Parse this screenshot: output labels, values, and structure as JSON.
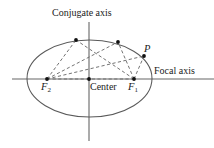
{
  "figure": {
    "type": "geometry-diagram",
    "width": 214,
    "height": 148,
    "background_color": "#ffffff",
    "stroke_color": "#4d4d4d",
    "dash_color": "#6b6b6b",
    "point_color": "#111111",
    "text_color": "#1a1a1a"
  },
  "labels": {
    "conjugate_axis": "Conjugate axis",
    "focal_axis": "Focal axis",
    "center": "Center",
    "focus_1": "F",
    "focus_1_sub": "1",
    "focus_2": "F",
    "focus_2_sub": "2",
    "point_p": "P"
  },
  "geometry": {
    "ellipse": {
      "cx": 89.5,
      "cy": 78.5,
      "rx": 62.5,
      "ry": 38.5
    },
    "focal_axis_line": {
      "x1": 12,
      "y1": 79,
      "x2": 214,
      "y2": 79
    },
    "conjugate_axis_line": {
      "x1": 89,
      "y1": 22,
      "x2": 89,
      "y2": 141
    },
    "points": [
      {
        "name": "center",
        "x": 89,
        "y": 79
      },
      {
        "name": "focus-1",
        "x": 134,
        "y": 79
      },
      {
        "name": "focus-2",
        "x": 47,
        "y": 79
      },
      {
        "name": "ellipse-point-a",
        "x": 76,
        "y": 40
      },
      {
        "name": "ellipse-point-b",
        "x": 118,
        "y": 42
      },
      {
        "name": "ellipse-point-p",
        "x": 144,
        "y": 56
      }
    ],
    "dashed_segments": [
      {
        "name": "f2-to-a",
        "x1": 47,
        "y1": 79,
        "x2": 76,
        "y2": 40
      },
      {
        "name": "f1-to-a",
        "x1": 134,
        "y1": 79,
        "x2": 76,
        "y2": 40
      },
      {
        "name": "f2-to-b",
        "x1": 47,
        "y1": 79,
        "x2": 118,
        "y2": 42
      },
      {
        "name": "f1-to-b",
        "x1": 134,
        "y1": 79,
        "x2": 118,
        "y2": 42
      },
      {
        "name": "f2-to-p",
        "x1": 47,
        "y1": 79,
        "x2": 144,
        "y2": 56
      },
      {
        "name": "f1-to-p",
        "x1": 134,
        "y1": 79,
        "x2": 144,
        "y2": 56
      },
      {
        "name": "f2-to-f1",
        "x1": 47,
        "y1": 79,
        "x2": 134,
        "y2": 79
      }
    ]
  }
}
